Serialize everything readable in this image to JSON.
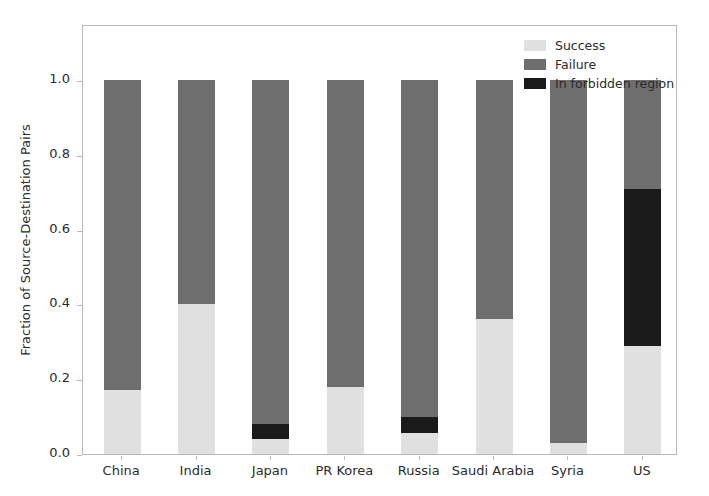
{
  "chart_data": {
    "type": "bar",
    "subtype": "stacked-bar",
    "title": "",
    "xlabel": "",
    "ylabel": "Fraction of Source-Destination Pairs",
    "ylim": [
      0.0,
      1.15
    ],
    "yticks": [
      "0.0",
      "0.2",
      "0.4",
      "0.6",
      "0.8",
      "1.0"
    ],
    "ytick_values": [
      0.0,
      0.2,
      0.4,
      0.6,
      0.8,
      1.0
    ],
    "grid": false,
    "legend_position": "upper right",
    "categories": [
      "China",
      "India",
      "Japan",
      "PR Korea",
      "Russia",
      "Saudi Arabia",
      "Syria",
      "US"
    ],
    "series": [
      {
        "name": "Success",
        "color": "#e0e0e0",
        "values": [
          0.17,
          0.4,
          0.04,
          0.18,
          0.055,
          0.36,
          0.03,
          0.29
        ]
      },
      {
        "name": "In forbidden region",
        "color": "#1a1a1a",
        "values": [
          0.0,
          0.0,
          0.04,
          0.0,
          0.045,
          0.0,
          0.0,
          0.42
        ]
      },
      {
        "name": "Failure",
        "color": "#6e6e6e",
        "values": [
          0.83,
          0.6,
          0.92,
          0.82,
          0.9,
          0.64,
          0.97,
          0.29
        ]
      }
    ],
    "stack_order_bottom_to_top": [
      "Success",
      "In forbidden region",
      "Failure"
    ],
    "bar_totals": [
      1.0,
      1.0,
      1.0,
      1.0,
      1.0,
      1.0,
      1.0,
      1.0
    ]
  },
  "legend": {
    "items": [
      {
        "label": "Success",
        "color": "#e0e0e0"
      },
      {
        "label": "Failure",
        "color": "#6e6e6e"
      },
      {
        "label": "In forbidden region",
        "color": "#1a1a1a"
      }
    ]
  },
  "axes": {
    "y_label": "Fraction of Source-Destination Pairs"
  }
}
